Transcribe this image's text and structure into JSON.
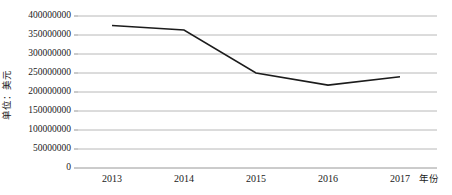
{
  "chart_data": {
    "type": "line",
    "title": "",
    "subtitle": "",
    "xlabel": "年份",
    "ylabel": "单位：美元",
    "categories": [
      "2013",
      "2014",
      "2015",
      "2016",
      "2017"
    ],
    "x": [
      2013,
      2014,
      2015,
      2016,
      2017
    ],
    "series": [
      {
        "name": "",
        "values": [
          375000000,
          363000000,
          250000000,
          218000000,
          240000000
        ]
      }
    ],
    "ylim": [
      0,
      400000000
    ],
    "ytick_labels": [
      "400000000",
      "350000000",
      "300000000",
      "250000000",
      "200000000",
      "150000000",
      "100000000",
      "50000000",
      "0"
    ],
    "ytick_values": [
      400000000,
      350000000,
      300000000,
      250000000,
      200000000,
      150000000,
      100000000,
      50000000,
      0
    ],
    "xtick_labels": [
      "2013",
      "2014",
      "2015",
      "2016",
      "2017"
    ],
    "grid": true,
    "grid_axis": "y",
    "legend": false,
    "legend_position": "none",
    "line_color": "#1c1c1c",
    "grid_color": "#a6a6a6",
    "background_color": "#ffffff",
    "markers": false,
    "annotations": []
  }
}
